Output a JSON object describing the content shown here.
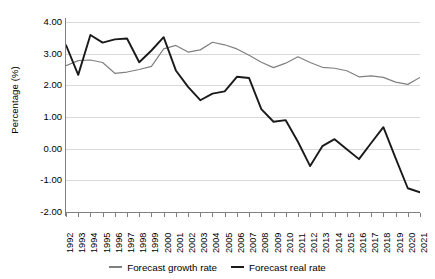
{
  "chart_data": {
    "type": "line",
    "title": "",
    "xlabel": "",
    "ylabel": "Percentage (%)",
    "ylim": [
      -2.0,
      4.0
    ],
    "yticks": [
      "4.00",
      "3.00",
      "2.00",
      "1.00",
      "0.00",
      "-1.00",
      "-2.00"
    ],
    "ytick_values": [
      4,
      3,
      2,
      1,
      0,
      -1,
      -2
    ],
    "grid": "horizontal",
    "legend_position": "bottom",
    "x": [
      "1992",
      "1993",
      "1994",
      "1995",
      "1996",
      "1997",
      "1998",
      "1999",
      "2000",
      "2001",
      "2002",
      "2003",
      "2004",
      "2005",
      "2006",
      "2007",
      "2008",
      "2009",
      "2010",
      "2011",
      "2012",
      "2013",
      "2014",
      "2015",
      "2016",
      "2017",
      "2018",
      "2019",
      "2020",
      "2021"
    ],
    "categories": [
      "1992",
      "1993",
      "1994",
      "1995",
      "1996",
      "1997",
      "1998",
      "1999",
      "2000",
      "2001",
      "2002",
      "2003",
      "2004",
      "2005",
      "2006",
      "2007",
      "2008",
      "2009",
      "2010",
      "2011",
      "2012",
      "2013",
      "2014",
      "2015",
      "2016",
      "2017",
      "2018",
      "2019",
      "2020",
      "2021"
    ],
    "series": [
      {
        "name": "Forecast growth rate",
        "color": "#808080",
        "values": [
          2.62,
          2.78,
          2.8,
          2.72,
          2.38,
          2.42,
          2.5,
          2.6,
          3.15,
          3.26,
          3.05,
          3.12,
          3.36,
          3.28,
          3.15,
          2.95,
          2.73,
          2.56,
          2.7,
          2.9,
          2.72,
          2.57,
          2.54,
          2.46,
          2.27,
          2.3,
          2.25,
          2.1,
          2.03,
          2.25
        ]
      },
      {
        "name": "Forecast real rate",
        "color": "#1a1a1a",
        "values": [
          3.27,
          2.33,
          3.59,
          3.35,
          3.45,
          3.48,
          2.73,
          3.1,
          3.52,
          2.47,
          1.95,
          1.53,
          1.74,
          1.81,
          2.27,
          2.23,
          1.25,
          0.85,
          0.9,
          0.22,
          -0.55,
          0.08,
          0.3,
          -0.02,
          -0.33,
          0.18,
          0.68,
          -0.3,
          -1.25,
          -1.38
        ]
      }
    ]
  },
  "legend": {
    "items": [
      {
        "label": "Forecast growth rate",
        "color": "#808080"
      },
      {
        "label": "Forecast real rate",
        "color": "#1a1a1a"
      }
    ]
  }
}
